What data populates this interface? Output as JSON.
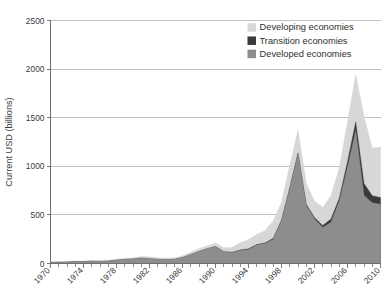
{
  "chart_data": {
    "type": "area",
    "stacked": true,
    "title": "",
    "subtitle": "",
    "xlabel": "",
    "ylabel": "Current USD (billions)",
    "xlim": [
      1970,
      2010
    ],
    "ylim": [
      0,
      2500
    ],
    "yticks": [
      0,
      500,
      1000,
      1500,
      2000,
      2500
    ],
    "ytick_labels": [
      "0",
      "500",
      "1000",
      "1500",
      "2000",
      "2500"
    ],
    "xticks": [
      1970,
      1974,
      1978,
      1982,
      1986,
      1990,
      1994,
      1998,
      2002,
      2006,
      2010
    ],
    "xtick_labels": [
      "1970",
      "1974",
      "1978",
      "1982",
      "1986",
      "1990",
      "1994",
      "1998",
      "2002",
      "2006",
      "2010"
    ],
    "x_minor_tick_interval": 1,
    "grid": "horizontal",
    "legend_position": "top-right",
    "x": [
      1970,
      1971,
      1972,
      1973,
      1974,
      1975,
      1976,
      1977,
      1978,
      1979,
      1980,
      1981,
      1982,
      1983,
      1984,
      1985,
      1986,
      1987,
      1988,
      1989,
      1990,
      1991,
      1992,
      1993,
      1994,
      1995,
      1996,
      1997,
      1998,
      1999,
      2000,
      2001,
      2002,
      2003,
      2004,
      2005,
      2006,
      2007,
      2008,
      2009,
      2010
    ],
    "series": [
      {
        "name": "Developed economies",
        "color": "#8d8d8d",
        "values": [
          12,
          14,
          16,
          21,
          20,
          24,
          22,
          26,
          35,
          42,
          47,
          56,
          50,
          43,
          40,
          43,
          63,
          92,
          125,
          153,
          174,
          120,
          112,
          133,
          145,
          190,
          205,
          250,
          440,
          770,
          1130,
          600,
          460,
          370,
          425,
          640,
          990,
          1365,
          700,
          625,
          610
        ],
        "stack_order": 1
      },
      {
        "name": "Transition economies",
        "color": "#3a3a3a",
        "values": [
          0,
          0,
          0,
          0,
          0,
          0,
          0,
          0,
          0,
          0,
          0,
          0,
          0,
          0,
          0,
          0,
          0,
          0,
          0,
          0,
          1,
          2,
          4,
          6,
          6,
          6,
          7,
          10,
          8,
          10,
          8,
          10,
          12,
          20,
          34,
          32,
          58,
          92,
          122,
          72,
          68
        ],
        "stack_order": 2
      },
      {
        "name": "Developing economies",
        "color": "#d7d7d7",
        "values": [
          3,
          4,
          5,
          6,
          6,
          8,
          7,
          8,
          10,
          12,
          12,
          17,
          20,
          17,
          16,
          16,
          17,
          25,
          30,
          30,
          35,
          40,
          50,
          75,
          95,
          105,
          125,
          180,
          185,
          230,
          235,
          215,
          170,
          185,
          240,
          310,
          410,
          490,
          690,
          490,
          520
        ],
        "stack_order": 3
      }
    ],
    "legend": [
      {
        "label": "Developing economies",
        "color": "#d7d7d7"
      },
      {
        "label": "Transition economies",
        "color": "#3a3a3a"
      },
      {
        "label": "Developed economies",
        "color": "#8d8d8d"
      }
    ]
  },
  "colors": {
    "background": "#ffffff",
    "axis": "#6e6e6e",
    "gridline": "#b9b9b9",
    "text": "#3c3c3c",
    "developed": "#8d8d8d",
    "transition": "#3a3a3a",
    "developing": "#d7d7d7"
  }
}
